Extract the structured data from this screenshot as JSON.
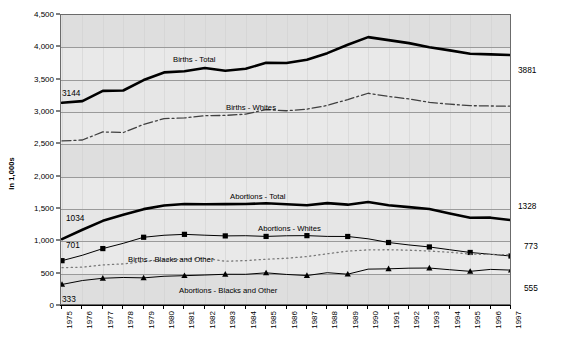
{
  "chart_data": {
    "type": "line",
    "title": "",
    "xlabel": "",
    "ylabel": "In 1,000s",
    "ylim": [
      0,
      4500
    ],
    "ytick_step": 500,
    "grid": true,
    "legend_position": "inline-labels",
    "categories": [
      "1975",
      "1976",
      "1977",
      "1978",
      "1979",
      "1980",
      "1981",
      "1982",
      "1983",
      "1984",
      "1985",
      "1986",
      "1987",
      "1988",
      "1989",
      "1990",
      "1991",
      "1992",
      "1993",
      "1994",
      "1995",
      "1996",
      "1997"
    ],
    "series": [
      {
        "name": "Births - Total",
        "marker": "none",
        "style": "thick-solid",
        "color": "#000000",
        "start_label": "3144",
        "end_label": "3881",
        "values": [
          3144,
          3168,
          3327,
          3333,
          3494,
          3612,
          3629,
          3681,
          3639,
          3669,
          3761,
          3757,
          3809,
          3910,
          4041,
          4158,
          4111,
          4065,
          4000,
          3953,
          3900,
          3891,
          3881
        ]
      },
      {
        "name": "Births - Whites",
        "marker": "none",
        "style": "dash-dot",
        "color": "#404040",
        "start_label": "",
        "end_label": "",
        "values": [
          2552,
          2567,
          2692,
          2682,
          2808,
          2898,
          2908,
          2943,
          2947,
          2967,
          3038,
          3019,
          3044,
          3102,
          3192,
          3290,
          3241,
          3202,
          3150,
          3121,
          3098,
          3093,
          3090
        ]
      },
      {
        "name": "Abortions - Total",
        "marker": "none",
        "style": "thick-solid",
        "color": "#000000",
        "start_label": "1034",
        "end_label": "1328",
        "values": [
          1034,
          1179,
          1317,
          1410,
          1498,
          1554,
          1577,
          1574,
          1575,
          1577,
          1589,
          1574,
          1559,
          1591,
          1567,
          1609,
          1557,
          1529,
          1500,
          1431,
          1364,
          1366,
          1328
        ]
      },
      {
        "name": "Abortions - Whites",
        "marker": "square",
        "style": "thin-solid",
        "color": "#000000",
        "start_label": "701",
        "end_label": "773",
        "values": [
          701,
          785,
          888,
          969,
          1063,
          1094,
          1108,
          1095,
          1084,
          1087,
          1076,
          1086,
          1088,
          1076,
          1075,
          1039,
          982,
          944,
          913,
          870,
          828,
          800,
          773
        ]
      },
      {
        "name": "Births - Blacks and Other",
        "marker": "none",
        "style": "dotted",
        "color": "#7a7a7a",
        "start_label": "",
        "end_label": "",
        "values": [
          592,
          601,
          635,
          651,
          686,
          714,
          721,
          738,
          692,
          702,
          723,
          738,
          765,
          808,
          849,
          868,
          870,
          863,
          850,
          832,
          802,
          798,
          791
        ]
      },
      {
        "name": "Abortions - Blacks and Other",
        "marker": "triangle",
        "style": "thin-solid",
        "color": "#000000",
        "start_label": "333",
        "end_label": "555",
        "values": [
          333,
          394,
          429,
          441,
          435,
          460,
          469,
          479,
          491,
          490,
          513,
          488,
          471,
          515,
          492,
          570,
          575,
          585,
          587,
          561,
          536,
          566,
          555
        ]
      }
    ],
    "value_annotations": {
      "left": [
        "3144",
        "1034",
        "701",
        "333"
      ],
      "right": [
        "3881",
        "1328",
        "773",
        "555"
      ]
    }
  }
}
